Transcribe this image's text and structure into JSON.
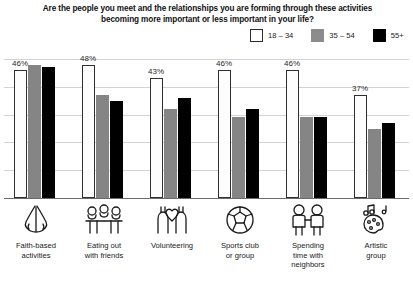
{
  "title": "Are the people you meet and the relationships you are forming through these activities becoming more important or less important in your life?",
  "legend": {
    "items": [
      {
        "label": "18 – 34",
        "color": "#ffffff",
        "icon": "white-square-swatch"
      },
      {
        "label": "35 – 54",
        "color": "#8c8c8c",
        "icon": "gray-square-swatch"
      },
      {
        "label": "55+",
        "color": "#000000",
        "icon": "black-square-swatch"
      }
    ]
  },
  "chart_data": {
    "type": "bar",
    "title": "Are the people you meet and the relationships you are forming through these activities becoming more important or less important in your life?",
    "xlabel": "",
    "ylabel": "",
    "ylim": [
      0,
      50
    ],
    "grid": true,
    "gridlines": [
      10,
      20,
      30,
      40,
      50
    ],
    "legend_position": "top-right",
    "categories": [
      "Faith-based activities",
      "Eating out with friends",
      "Volunteering",
      "Sports club or group",
      "Spending time with neighbors",
      "Artistic group"
    ],
    "series": [
      {
        "name": "18 – 34",
        "color": "#ffffff",
        "values": [
          46,
          48,
          43,
          46,
          46,
          37
        ]
      },
      {
        "name": "35 – 54",
        "color": "#8c8c8c",
        "values": [
          48,
          37,
          32,
          29,
          29,
          25
        ]
      },
      {
        "name": "55+",
        "color": "#000000",
        "values": [
          47,
          35,
          36,
          32,
          29,
          27
        ]
      }
    ],
    "data_labels": [
      "46%",
      "48%",
      "43%",
      "46%",
      "46%",
      "37%"
    ],
    "data_label_series": "18 – 34"
  },
  "categories": [
    {
      "label_line1": "Faith-based",
      "label_line2": "activities",
      "label_line3": "",
      "icon": "praying-hands-icon"
    },
    {
      "label_line1": "Eating out",
      "label_line2": "with friends",
      "label_line3": "",
      "icon": "dining-table-icon"
    },
    {
      "label_line1": "Volunteering",
      "label_line2": "",
      "label_line3": "",
      "icon": "raised-hands-heart-icon"
    },
    {
      "label_line1": "Sports club",
      "label_line2": "or group",
      "label_line3": "",
      "icon": "soccer-ball-icon"
    },
    {
      "label_line1": "Spending",
      "label_line2": "time with",
      "label_line3": "neighbors",
      "icon": "two-neighbors-icon"
    },
    {
      "label_line1": "Artistic",
      "label_line2": "group",
      "label_line3": "",
      "icon": "music-palette-icon"
    }
  ],
  "footnote": ""
}
